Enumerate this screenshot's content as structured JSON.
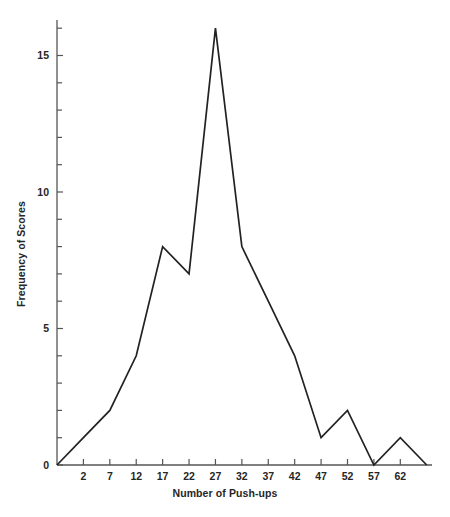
{
  "chart_data": {
    "type": "line",
    "title": "",
    "subtitle": "",
    "xlabel": "Number of Push-ups",
    "ylabel": "Frequency of Scores",
    "xlim": [
      -3,
      68
    ],
    "ylim": [
      0,
      16.3
    ],
    "grid": false,
    "legend": "none",
    "x_tick_labels": [
      "2",
      "7",
      "12",
      "17",
      "22",
      "27",
      "32",
      "37",
      "42",
      "47",
      "52",
      "57",
      "62"
    ],
    "x_ticks": [
      2,
      7,
      12,
      17,
      22,
      27,
      32,
      37,
      42,
      47,
      52,
      57,
      62
    ],
    "y_tick_labels": [
      "0",
      "5",
      "10",
      "15"
    ],
    "y_ticks": [
      0,
      5,
      10,
      15
    ],
    "y_minor_ticks": [
      1,
      2,
      3,
      4,
      6,
      7,
      8,
      9,
      11,
      12,
      13,
      14,
      16
    ],
    "series": [
      {
        "name": "Frequency of Scores",
        "color": "#222222",
        "x": [
          -3,
          2,
          7,
          12,
          17,
          22,
          27,
          32,
          37,
          42,
          47,
          52,
          57,
          62,
          67
        ],
        "values": [
          0,
          1,
          2,
          4,
          8,
          7,
          16,
          8,
          6,
          4,
          1,
          2,
          0,
          1,
          0
        ]
      }
    ]
  },
  "axis": {
    "line_color": "#555555",
    "tick_color": "#555555"
  }
}
